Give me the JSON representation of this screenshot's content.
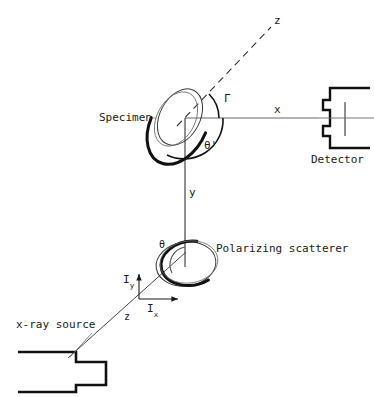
{
  "figure": {
    "type": "schematic-diagram",
    "background_color": "#ffffff",
    "line_color": "#1a1a1a"
  },
  "labels": {
    "specimen": "Specimen",
    "detector": "Detector",
    "polarizing_scatterer": "Polarizing scatterer",
    "xray_source": "x-ray source",
    "axis_z_top": "z",
    "axis_z_beam": "z",
    "axis_x": "x",
    "axis_y": "y",
    "angle_gamma": "Γ",
    "angle_theta_prime": "θ'",
    "angle_theta": "θ",
    "intensity_y": "I",
    "intensity_y_sub": "y",
    "intensity_x": "I",
    "intensity_x_sub": "x"
  },
  "geometry": {
    "specimen_origin": [
      185,
      118
    ],
    "scatterer_origin": [
      185,
      265
    ],
    "intensity_origin": [
      139,
      299
    ],
    "z_axis_angle_deg": 45,
    "detector_position": [
      322,
      118
    ],
    "source_position": [
      28,
      362
    ]
  },
  "icons": {
    "specimen": "ellipse-disk-icon",
    "scatterer": "ellipse-disk-icon",
    "detector": "detector-bracket-icon",
    "source": "xray-tube-icon"
  }
}
